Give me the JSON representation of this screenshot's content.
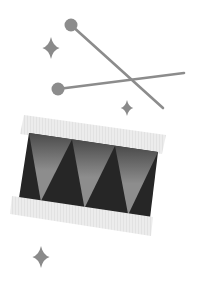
{
  "illustration": {
    "title": "Drum with drumsticks and sparkles",
    "colors": {
      "background": "#ffffff",
      "stick": "#8c8c8c",
      "sparkle": "#8a8a8a",
      "rim": "#ececec",
      "rim_stripe": "#e2e2e2",
      "body_dark": "#262626",
      "body_light": "#8d8d8d",
      "body_light_top": "#4a4a4a"
    },
    "drumsticks": [
      {
        "name": "stick-diagonal",
        "ball": {
          "cx": 71,
          "cy": 25,
          "r": 6.5
        },
        "end": {
          "x": 163,
          "y": 108
        }
      },
      {
        "name": "stick-horizontal",
        "ball": {
          "cx": 58,
          "cy": 89,
          "r": 6.5
        },
        "end": {
          "x": 184,
          "y": 73
        }
      }
    ],
    "sparkles": [
      {
        "name": "sparkle-large-top",
        "cx": 51,
        "cy": 48,
        "size": 22
      },
      {
        "name": "sparkle-small-middle",
        "cx": 127,
        "cy": 108,
        "size": 16
      },
      {
        "name": "sparkle-large-bottom",
        "cx": 41,
        "cy": 257,
        "size": 22
      }
    ],
    "drum": {
      "body": {
        "tl": [
          29,
          133
        ],
        "tr": [
          158,
          152
        ],
        "br": [
          150,
          218
        ],
        "bl": [
          19,
          198
        ]
      },
      "top_rim": {
        "tl": [
          24,
          115
        ],
        "tr": [
          166,
          135
        ],
        "br": [
          162,
          154
        ],
        "bl": [
          20,
          134
        ]
      },
      "bottom_rim": {
        "tl": [
          12,
          196
        ],
        "tr": [
          153,
          217
        ],
        "br": [
          151,
          236
        ],
        "bl": [
          10,
          214
        ]
      },
      "zigzag_segments": 3
    }
  }
}
